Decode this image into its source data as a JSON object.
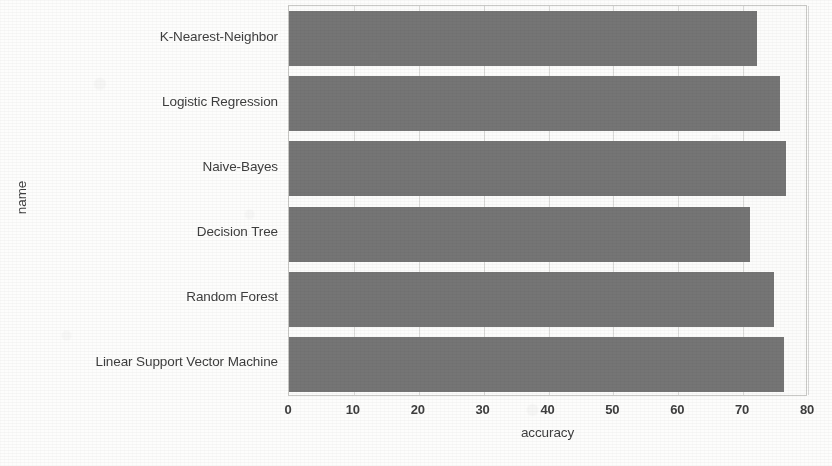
{
  "chart_data": {
    "type": "bar",
    "orientation": "horizontal",
    "title": "",
    "xlabel": "accuracy",
    "ylabel": "name",
    "categories": [
      "K-Nearest-Neighbor",
      "Logistic Regression",
      "Naive-Bayes",
      "Decision Tree",
      "Random Forest",
      "Linear Support Vector Machine"
    ],
    "values": [
      72.1,
      75.7,
      76.6,
      71.0,
      74.7,
      76.3
    ],
    "xlim": [
      0,
      80
    ],
    "xticks": [
      0,
      10,
      20,
      30,
      40,
      50,
      60,
      70,
      80
    ],
    "xtick_labels": [
      "0",
      "10",
      "20",
      "30",
      "40",
      "50",
      "60",
      "70",
      "80"
    ],
    "grid": true,
    "legend": false,
    "bar_color": "#757575",
    "background_color": "#fcfcfb",
    "axis_color": "#c9c9c6",
    "text_color": "#3e3e3e"
  }
}
